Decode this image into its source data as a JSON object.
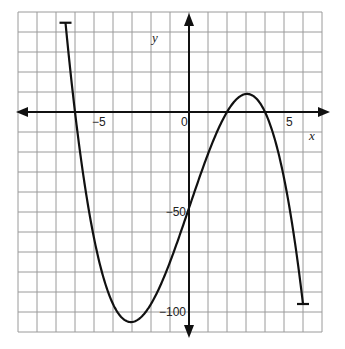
{
  "header": {
    "title_fragment": "graph"
  },
  "chart_data": {
    "type": "line",
    "title": "",
    "xlabel": "x",
    "ylabel": "y",
    "xlim": [
      -9,
      7
    ],
    "ylim": [
      -110,
      50
    ],
    "x_grid_step": 1,
    "y_grid_step": 10,
    "grid": true,
    "x_tick_labels": [
      {
        "value": -5,
        "label": "−5"
      },
      {
        "value": 0,
        "label": "0"
      },
      {
        "value": 5,
        "label": "5"
      }
    ],
    "y_tick_labels": [
      {
        "value": -50,
        "label": "−50"
      },
      {
        "value": -100,
        "label": "−100"
      }
    ],
    "series": [
      {
        "name": "f(x) = −(x+6)(x−2)(x−4)",
        "domain": [
          -6.5,
          6
        ],
        "endpoints_marked": true,
        "key_points": [
          {
            "x": -6.5,
            "y": 44.6,
            "note": "left endpoint"
          },
          {
            "x": -6,
            "y": 0,
            "note": "x-intercept"
          },
          {
            "x": -3,
            "y": -105,
            "note": "local minimum"
          },
          {
            "x": 0,
            "y": -48,
            "note": "y-intercept"
          },
          {
            "x": 2,
            "y": 0,
            "note": "x-intercept"
          },
          {
            "x": 3,
            "y": 9,
            "note": "local maximum"
          },
          {
            "x": 4,
            "y": 0,
            "note": "x-intercept"
          },
          {
            "x": 6,
            "y": -96,
            "note": "right endpoint"
          }
        ]
      }
    ]
  },
  "style": {
    "grid_color": "#9a9a9a",
    "axis_color": "#111111",
    "curve_color": "#111111"
  }
}
